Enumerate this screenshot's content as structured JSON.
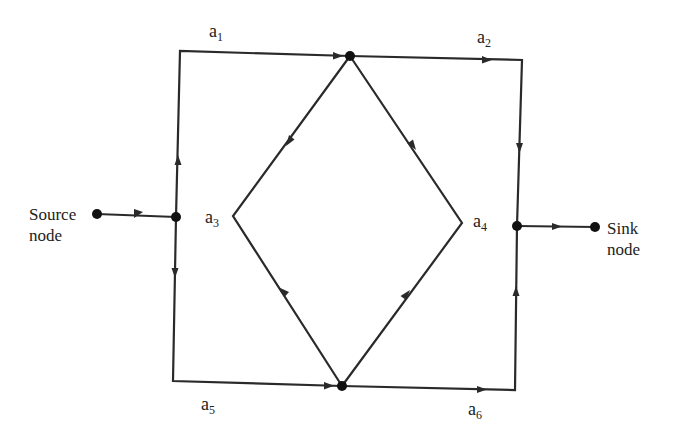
{
  "diagram": {
    "type": "flow network (source-to-sink directed graph)",
    "colors": {
      "line": "#2a2a2a",
      "node": "#111111",
      "background": "#ffffff"
    },
    "source": {
      "line1": "Source",
      "line2": "node"
    },
    "sink": {
      "line1": "Sink",
      "line2": "node"
    },
    "edges": [
      {
        "id": "a1",
        "base": "a",
        "sub": "1"
      },
      {
        "id": "a2",
        "base": "a",
        "sub": "2"
      },
      {
        "id": "a3",
        "base": "a",
        "sub": "3"
      },
      {
        "id": "a4",
        "base": "a",
        "sub": "4"
      },
      {
        "id": "a5",
        "base": "a",
        "sub": "5"
      },
      {
        "id": "a6",
        "base": "a",
        "sub": "6"
      }
    ]
  }
}
